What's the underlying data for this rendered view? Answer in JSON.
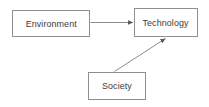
{
  "diagram": {
    "background_color": "#ffffff",
    "border_color": "#8f8f8f",
    "text_color": "#3b3b3b",
    "edge_color": "#8a8a8a",
    "nodes": [
      {
        "id": "environment",
        "label": "Environment"
      },
      {
        "id": "technology",
        "label": "Technology"
      },
      {
        "id": "society",
        "label": "Society"
      }
    ],
    "edges": [
      {
        "id": "environment-to-technology",
        "from": "Environment",
        "to": "Technology",
        "style": "solid",
        "arrowhead": "filled-triangle"
      },
      {
        "id": "society-to-technology",
        "from": "Society",
        "to": "Technology",
        "style": "solid",
        "arrowhead": "filled-triangle"
      }
    ]
  }
}
